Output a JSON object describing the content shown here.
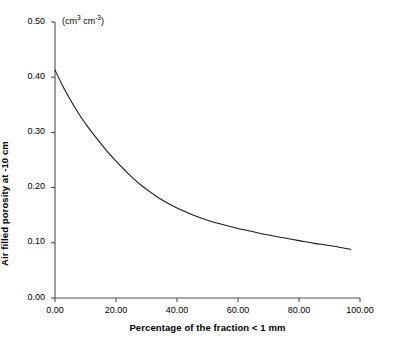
{
  "chart_data": {
    "type": "line",
    "title": "",
    "subtitle": "",
    "annotation": "(cm3 cm-3)",
    "annotation_parts": {
      "base1": "(cm",
      "sup1": "3",
      "mid": " cm",
      "sup2": "-3",
      "base2": ")"
    },
    "xlabel": "Percentage of the fraction < 1 mm",
    "ylabel": "Air filled porosity at -10 cm",
    "xlim": [
      0.0,
      100.0
    ],
    "ylim": [
      0.0,
      0.5
    ],
    "xticks": [
      0.0,
      20.0,
      40.0,
      60.0,
      80.0,
      100.0
    ],
    "xtick_labels": [
      "0.00",
      "20.00",
      "40.00",
      "60.00",
      "80.00",
      "100.00"
    ],
    "yticks": [
      0.0,
      0.1,
      0.2,
      0.3,
      0.4,
      0.5
    ],
    "ytick_labels": [
      "0.00",
      "0.10",
      "0.20",
      "0.30",
      "0.40",
      "0.50"
    ],
    "grid": false,
    "legend": false,
    "legend_position": "none",
    "line_color": "#1a1a1a",
    "axis_color": "#4d4d4d",
    "series": [
      {
        "name": "Air filled porosity",
        "x": [
          0.0,
          2.0,
          4.0,
          6.0,
          8.0,
          10.0,
          12.0,
          14.0,
          16.0,
          18.0,
          20.0,
          23.0,
          26.0,
          29.0,
          32.0,
          35.0,
          40.0,
          45.0,
          50.0,
          55.0,
          60.0,
          65.0,
          70.0,
          75.0,
          80.0,
          85.0,
          90.0,
          97.0
        ],
        "y": [
          0.413,
          0.39,
          0.369,
          0.35,
          0.332,
          0.316,
          0.301,
          0.287,
          0.273,
          0.26,
          0.248,
          0.231,
          0.215,
          0.201,
          0.189,
          0.178,
          0.163,
          0.151,
          0.141,
          0.133,
          0.126,
          0.12,
          0.114,
          0.109,
          0.104,
          0.099,
          0.095,
          0.088
        ]
      }
    ]
  }
}
